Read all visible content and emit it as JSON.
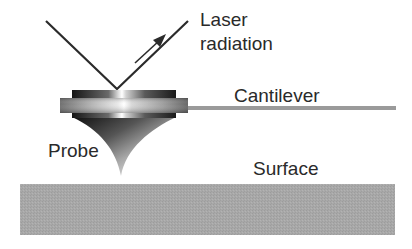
{
  "diagram": {
    "labels": {
      "laser_line1": "Laser",
      "laser_line2": "radiation",
      "cantilever": "Cantilever",
      "probe": "Probe",
      "surface": "Surface"
    },
    "colors": {
      "background": "#ffffff",
      "line": "#2b2b2b",
      "cantilever": "#9a9a9a",
      "surface": "#a9a9a9",
      "text": "#2a2a2a"
    }
  }
}
